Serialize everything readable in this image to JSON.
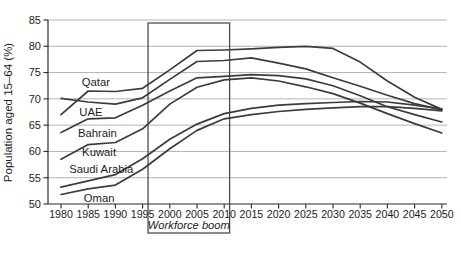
{
  "chart_data": {
    "type": "line",
    "title": "",
    "xlabel": "",
    "ylabel": "Population aged 15–64 (%)",
    "x": [
      1980,
      1985,
      1990,
      1995,
      2000,
      2005,
      2010,
      2015,
      2020,
      2025,
      2030,
      2035,
      2040,
      2045,
      2050
    ],
    "x_tick_labels": [
      "1980",
      "1985",
      "1990",
      "1995",
      "2000",
      "2005",
      "2010",
      "2015",
      "2020",
      "2025",
      "2030",
      "2035",
      "2040",
      "2045",
      "2050"
    ],
    "y_ticks": [
      50,
      55,
      60,
      65,
      70,
      75,
      80,
      85
    ],
    "ylim": [
      50,
      85
    ],
    "xlim": [
      1980,
      2050
    ],
    "grid": true,
    "legend_position": "inline-labels",
    "series": [
      {
        "name": "Qatar",
        "values": [
          67.0,
          71.5,
          71.4,
          72.0,
          75.5,
          79.2,
          79.3,
          79.5,
          79.8,
          80.0,
          79.6,
          77.0,
          73.4,
          70.3,
          68.0
        ],
        "label": "Qatar",
        "label_year": 1986.4,
        "label_value": 72.5
      },
      {
        "name": "UAE",
        "values": [
          70.1,
          69.4,
          69.0,
          70.2,
          73.7,
          77.1,
          77.3,
          77.8,
          76.8,
          75.7,
          74.0,
          72.4,
          70.7,
          69.1,
          67.9
        ],
        "label": "UAE",
        "label_year": 1985.5,
        "label_value": 66.7
      },
      {
        "name": "Bahrain",
        "values": [
          63.6,
          66.2,
          66.4,
          68.8,
          71.5,
          74.0,
          74.3,
          74.6,
          74.4,
          73.8,
          72.5,
          70.6,
          68.5,
          67.0,
          65.6
        ],
        "label": "Bahrain",
        "label_year": 1986.7,
        "label_value": 62.8
      },
      {
        "name": "Kuwait",
        "values": [
          58.5,
          61.3,
          61.7,
          64.3,
          69.0,
          72.2,
          73.6,
          74.0,
          73.4,
          72.3,
          71.0,
          69.2,
          67.2,
          65.3,
          63.5
        ],
        "label": "Kuwait",
        "label_year": 1987.0,
        "label_value": 59.2
      },
      {
        "name": "Saudi Arabia",
        "values": [
          53.2,
          54.4,
          55.6,
          58.6,
          62.3,
          65.2,
          67.2,
          68.2,
          68.8,
          69.1,
          69.3,
          69.5,
          69.4,
          68.8,
          68.1
        ],
        "label": "Saudi Arabia",
        "label_year": 1987.4,
        "label_value": 55.9
      },
      {
        "name": "Oman",
        "values": [
          51.8,
          52.9,
          53.6,
          56.6,
          60.5,
          64.0,
          66.2,
          67.0,
          67.6,
          68.0,
          68.3,
          68.5,
          68.5,
          68.2,
          67.7
        ],
        "label": "Oman",
        "label_year": 1987.0,
        "label_value": 50.4
      }
    ],
    "annotation": {
      "text": "Workforce boom",
      "box_year_start": 1996,
      "box_year_end": 2011
    }
  },
  "styles": {
    "line_color": "#3c3c3c",
    "grid_color": "#ababab",
    "axis_color": "#2b2b2b",
    "text_color": "#1c1c1c",
    "annotation_box_color": "#3f3f3f",
    "background": "#ffffff"
  }
}
